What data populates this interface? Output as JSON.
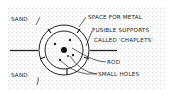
{
  "diagram": {
    "type": "cross-section of a mould with core",
    "labels": {
      "sand_top": "SAND",
      "sand_bottom": "SAND",
      "space_for_metal": "SPACE FOR METAL",
      "chaplets_line1": "FUSIBLE SUPPORTS",
      "chaplets_line2": "CALLED 'CHAPLETS'",
      "rod": "ROD",
      "small_holes": "SMALL HOLES"
    },
    "colors": {
      "ink": "#222222",
      "background": "#ffffff",
      "stipple": "#9a9a9a"
    }
  }
}
